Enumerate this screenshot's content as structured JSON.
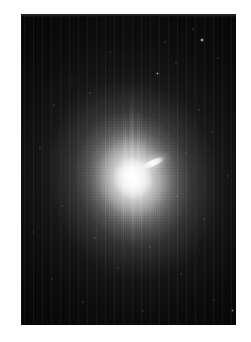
{
  "page": {
    "background_color": "#ffffff",
    "width": 251,
    "height": 342
  },
  "figure": {
    "name": "galaxy-astronomical-image",
    "kind": "grayscale-astronomical-photograph",
    "panel": {
      "left": 21,
      "top": 14,
      "width": 215,
      "height": 311,
      "background_color": "#000000",
      "top_edge_color": "#2e2e2e"
    },
    "galaxy": {
      "center_x": 133,
      "center_y": 178,
      "halo_rotation_deg": -16,
      "nucleus": {
        "x": 133,
        "y": 178,
        "diameter": 9,
        "color": "#ffffff"
      },
      "jet": {
        "x": 153,
        "y": 163,
        "length": 26,
        "thickness": 6,
        "angle_deg": -24,
        "color": "#ffffff"
      },
      "bleed_streaks": [
        {
          "x": 130,
          "y": 88,
          "width": 4,
          "height": 92
        },
        {
          "x": 137,
          "y": 100,
          "width": 3,
          "height": 80
        },
        {
          "x": 124,
          "y": 112,
          "width": 3,
          "height": 68
        },
        {
          "x": 143,
          "y": 120,
          "width": 2,
          "height": 60
        }
      ],
      "bleed_streaks_down": [
        {
          "x": 131,
          "y": 182,
          "width": 4,
          "height": 70
        },
        {
          "x": 139,
          "y": 182,
          "width": 3,
          "height": 56
        },
        {
          "x": 122,
          "y": 182,
          "width": 3,
          "height": 48
        }
      ]
    },
    "point_sources": [
      {
        "x": 202,
        "y": 40,
        "size": 4.5,
        "brightness": 0.95
      },
      {
        "x": 165,
        "y": 42,
        "size": 2.6,
        "brightness": 0.55
      },
      {
        "x": 193,
        "y": 29,
        "size": 2.2,
        "brightness": 0.45
      },
      {
        "x": 157,
        "y": 73,
        "size": 3.0,
        "brightness": 0.6
      },
      {
        "x": 176,
        "y": 63,
        "size": 2.0,
        "brightness": 0.4
      },
      {
        "x": 218,
        "y": 58,
        "size": 2.2,
        "brightness": 0.45
      },
      {
        "x": 90,
        "y": 93,
        "size": 2.6,
        "brightness": 0.5
      },
      {
        "x": 72,
        "y": 80,
        "size": 2.2,
        "brightness": 0.4
      },
      {
        "x": 54,
        "y": 105,
        "size": 2.6,
        "brightness": 0.5
      },
      {
        "x": 40,
        "y": 148,
        "size": 2.2,
        "brightness": 0.42
      },
      {
        "x": 199,
        "y": 110,
        "size": 2.2,
        "brightness": 0.4
      },
      {
        "x": 212,
        "y": 132,
        "size": 2.0,
        "brightness": 0.38
      },
      {
        "x": 186,
        "y": 153,
        "size": 2.0,
        "brightness": 0.36
      },
      {
        "x": 177,
        "y": 196,
        "size": 2.4,
        "brightness": 0.45
      },
      {
        "x": 204,
        "y": 219,
        "size": 2.2,
        "brightness": 0.4
      },
      {
        "x": 62,
        "y": 206,
        "size": 2.0,
        "brightness": 0.36
      },
      {
        "x": 95,
        "y": 238,
        "size": 2.6,
        "brightness": 0.5
      },
      {
        "x": 150,
        "y": 247,
        "size": 2.2,
        "brightness": 0.42
      },
      {
        "x": 118,
        "y": 268,
        "size": 2.0,
        "brightness": 0.38
      },
      {
        "x": 181,
        "y": 274,
        "size": 2.2,
        "brightness": 0.4
      },
      {
        "x": 52,
        "y": 279,
        "size": 2.0,
        "brightness": 0.36
      },
      {
        "x": 83,
        "y": 302,
        "size": 2.2,
        "brightness": 0.4
      },
      {
        "x": 214,
        "y": 300,
        "size": 2.0,
        "brightness": 0.38
      },
      {
        "x": 143,
        "y": 311,
        "size": 2.0,
        "brightness": 0.34
      },
      {
        "x": 232,
        "y": 310,
        "size": 3.0,
        "brightness": 0.55
      },
      {
        "x": 34,
        "y": 232,
        "size": 2.0,
        "brightness": 0.34
      },
      {
        "x": 228,
        "y": 176,
        "size": 2.0,
        "brightness": 0.34
      },
      {
        "x": 110,
        "y": 52,
        "size": 2.0,
        "brightness": 0.34
      }
    ]
  }
}
